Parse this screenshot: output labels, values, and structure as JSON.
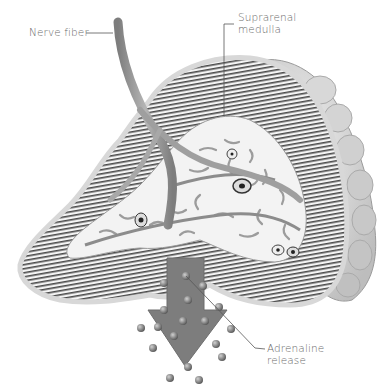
{
  "diagram": {
    "labels": {
      "nerve_fiber": "Nerve fiber",
      "suprarenal_medulla_line1": "Suprarenal",
      "suprarenal_medulla_line2": "medulla",
      "adrenaline_line1": "Adrenaline",
      "adrenaline_line2": "release"
    },
    "colors": {
      "background": "#ffffff",
      "cortex_stripe": "#555555",
      "capsule": "#cfcfcf",
      "medulla_fill": "#f2f2f2",
      "nerve": "#9a9a9a",
      "arrow": "#7b7b7b",
      "adrenaline_dot": "#7a7a7a",
      "label_text": "#6a6a6a",
      "leader_line": "#555555"
    }
  }
}
